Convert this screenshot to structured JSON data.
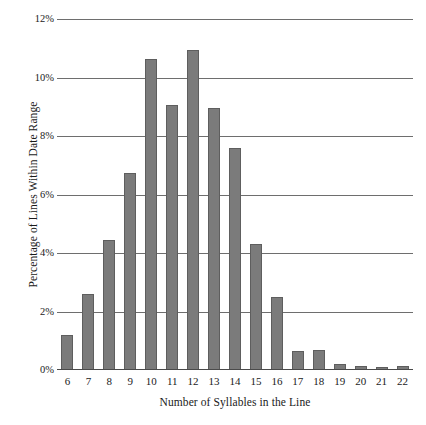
{
  "chart_data": {
    "type": "bar",
    "title": "",
    "xlabel": "Number of Syllables in the Line",
    "ylabel": "Percentage of Lines Within Date Range",
    "categories": [
      "6",
      "7",
      "8",
      "9",
      "10",
      "11",
      "12",
      "13",
      "14",
      "15",
      "16",
      "17",
      "18",
      "19",
      "20",
      "21",
      "22"
    ],
    "values": [
      1.2,
      2.6,
      4.45,
      6.75,
      10.65,
      9.05,
      10.95,
      8.95,
      7.6,
      4.3,
      2.5,
      0.65,
      0.7,
      0.2,
      0.15,
      0.1,
      0.15
    ],
    "ylim": [
      0,
      12
    ],
    "ytick_values": [
      0,
      2,
      4,
      6,
      8,
      10,
      12
    ],
    "ytick_labels": [
      "0%",
      "2%",
      "4%",
      "6%",
      "8%",
      "10%",
      "12%"
    ],
    "grid": true,
    "legend": null,
    "bar_color": "#7b7b7b",
    "bar_edge_color": "#5e5e5e",
    "gridline_color": "#6e6e6e",
    "background_color": "#ffffff",
    "text_color": "#1a1a1a"
  }
}
